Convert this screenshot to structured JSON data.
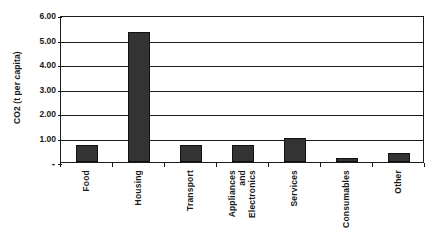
{
  "chart_data": {
    "type": "bar",
    "title": "",
    "subtitle": "",
    "xlabel": "",
    "ylabel": "CO2 (t per capita)",
    "categories": [
      "Food",
      "Housing",
      "Transport",
      "Appliances and Electronics",
      "Services",
      "Consumables",
      "Other"
    ],
    "category_label_lines": [
      [
        "Food"
      ],
      [
        "Housing"
      ],
      [
        "Transport"
      ],
      [
        "Appliances",
        "and",
        "Electronics"
      ],
      [
        "Services"
      ],
      [
        "Consumables"
      ],
      [
        "Other"
      ]
    ],
    "values": [
      0.7,
      5.3,
      0.7,
      0.7,
      1.0,
      0.15,
      0.35
    ],
    "ylim": [
      0,
      6
    ],
    "ytick_values": [
      0,
      1,
      2,
      3,
      4,
      5,
      6
    ],
    "ytick_labels": [
      "-",
      "1.00",
      "2.00",
      "3.00",
      "4.00",
      "5.00",
      "6.00"
    ],
    "ytick_interval": 1.0,
    "grid": "horizontal",
    "legend": "none",
    "bar_color": "#333333",
    "bar_border_color": "#111111",
    "axis_color": "#1a1a1a",
    "plot_background": "#ffffff",
    "figure_background": "#ffffff"
  }
}
